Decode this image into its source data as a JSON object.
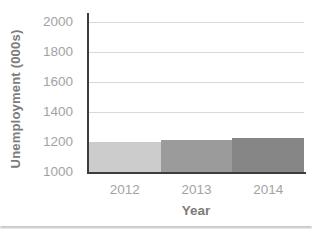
{
  "chart_data": {
    "type": "bar",
    "title": "",
    "categories": [
      "2012",
      "2013",
      "2014"
    ],
    "values": [
      1200,
      1215,
      1230
    ],
    "xlabel": "Year",
    "ylabel": "Unemployment (000s)",
    "ylim": [
      1000,
      2000
    ],
    "yticks": [
      1000,
      1200,
      1400,
      1600,
      1800,
      2000
    ],
    "grid": true,
    "legend": false,
    "bar_colors": [
      "#cccccc",
      "#9b9b9b",
      "#868686"
    ]
  },
  "colors": {
    "axis_line": "#3c3c3c",
    "gridline": "#d9d9d9",
    "tick_label": "#a3a3a3",
    "axis_title": "#7c7c7c",
    "divider": "#c2c2c2",
    "background": "#ffffff"
  }
}
